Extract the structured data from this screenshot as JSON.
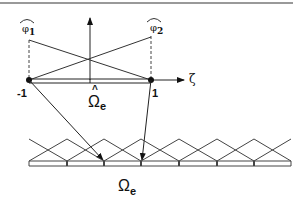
{
  "diagram": {
    "reference_element": {
      "shape_functions": [
        {
          "label": "φ",
          "subscript": "1",
          "hat": true
        },
        {
          "label": "φ",
          "subscript": "2",
          "hat": true
        }
      ],
      "node_left": "-1",
      "node_right": "1",
      "axis_label": "ζ",
      "domain_label": "Ω",
      "domain_subscript": "e",
      "domain_hat": "^"
    },
    "physical_mesh": {
      "domain_label": "Ω",
      "domain_subscript": "e",
      "element_count": 7
    },
    "colors": {
      "line": "#333333",
      "border": "#999999",
      "background": "#ffffff"
    }
  }
}
